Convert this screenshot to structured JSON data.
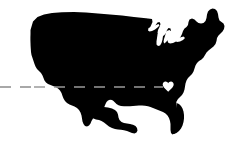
{
  "image": {
    "title": "United States silhouette with destination marker",
    "width": 236,
    "height": 149,
    "background_color": "#ffffff"
  },
  "map": {
    "region_label": "Contiguous United States",
    "land_color": "#000000",
    "water_cutout_color": "#ffffff",
    "lakes_label": "Great Lakes"
  },
  "route": {
    "label": "Dashed travel route",
    "style": "dashed",
    "color": "#8c8c8c",
    "stroke_width": 1.6,
    "dash_on": 11,
    "dash_off": 9,
    "start_x": 0,
    "end_x": 163,
    "y": 87
  },
  "marker": {
    "label": "Destination heart marker",
    "icon": "heart-icon",
    "color": "#ffffff",
    "x": 168,
    "y": 86,
    "size": 11
  }
}
